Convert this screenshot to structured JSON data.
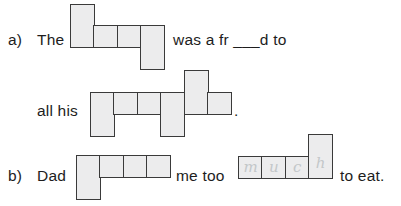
{
  "worksheet": {
    "background_color": "#ffffff",
    "box_fill_color": "#ececed",
    "box_border_color": "#3a3a3a",
    "pencil_color": "#c3c7c9",
    "items": [
      {
        "label": "a)",
        "lines": [
          {
            "segments": [
              {
                "kind": "text",
                "value": "The"
              },
              {
                "kind": "wordshape",
                "name": "wordshape-a-1",
                "cells": 4
              },
              {
                "kind": "text",
                "value": "was a fr ___d to"
              }
            ]
          },
          {
            "segments": [
              {
                "kind": "text",
                "value": "all his"
              },
              {
                "kind": "wordshape",
                "name": "wordshape-a-2",
                "cells": 6
              },
              {
                "kind": "text",
                "value": "."
              }
            ]
          }
        ]
      },
      {
        "label": "b)",
        "lines": [
          {
            "segments": [
              {
                "kind": "text",
                "value": "Dad"
              },
              {
                "kind": "wordshape",
                "name": "wordshape-b-1",
                "cells": 4
              },
              {
                "kind": "text",
                "value": "me too"
              },
              {
                "kind": "wordshape",
                "name": "wordshape-b-2",
                "cells": 4,
                "handwriting": [
                  "m",
                  "u",
                  "c",
                  "h"
                ]
              },
              {
                "kind": "text",
                "value": "to eat."
              }
            ]
          }
        ]
      }
    ],
    "text": {
      "a_label": "a)",
      "a_line1_pre": "The",
      "a_line1_post": "was a fr ___d to",
      "a_line2_pre": "all his",
      "a_line2_period": ".",
      "b_label": "b)",
      "b_pre": "Dad",
      "b_mid": "me too",
      "b_post": "to eat.",
      "b_handwriting_1": "m",
      "b_handwriting_2": "u",
      "b_handwriting_3": "c",
      "b_handwriting_4": "h"
    }
  }
}
